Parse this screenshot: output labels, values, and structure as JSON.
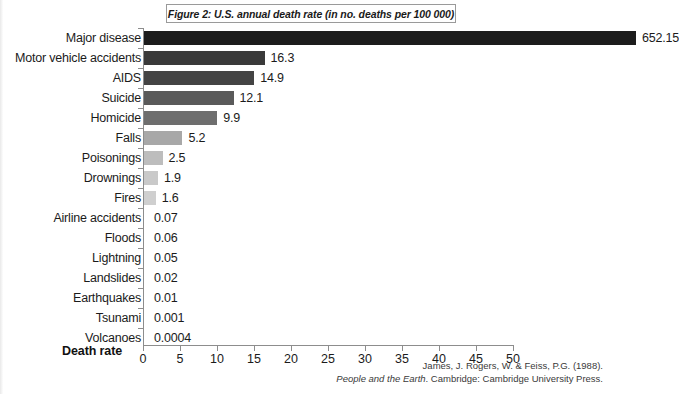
{
  "figure": {
    "title": "Figure 2: U.S. annual death rate (in no. deaths per 100 000)"
  },
  "axis": {
    "x_title": "Death rate",
    "ticks": [
      "0",
      "5",
      "10",
      "15",
      "20",
      "25",
      "30",
      "35",
      "40",
      "45",
      "50"
    ]
  },
  "source": {
    "line1": "James, J. Rogers, W. & Feiss, P.G. (1988).",
    "line2_italic": "People and the Earth",
    "line2_rest": ". Cambridge: Cambridge University Press."
  },
  "chart_data": {
    "type": "bar",
    "orientation": "horizontal",
    "title": "Figure 2: U.S. annual death rate (in no. deaths per 100 000)",
    "xlabel": "Death rate",
    "ylabel": "",
    "xlim": [
      0,
      50
    ],
    "xticks": [
      0,
      5,
      10,
      15,
      20,
      25,
      30,
      35,
      40,
      45,
      50
    ],
    "grid": false,
    "legend": "none",
    "note": "Top bar (Major disease, 652.15) greatly exceeds the axis range and is drawn clipped to full plot width.",
    "categories": [
      "Major disease",
      "Motor vehicle accidents",
      "AIDS",
      "Suicide",
      "Homicide",
      "Falls",
      "Poisonings",
      "Drownings",
      "Fires",
      "Airline accidents",
      "Floods",
      "Lightning",
      "Landslides",
      "Earthquakes",
      "Tsunami",
      "Volcanoes"
    ],
    "values": [
      652.15,
      16.3,
      14.9,
      12.1,
      9.9,
      5.2,
      2.5,
      1.9,
      1.6,
      0.07,
      0.06,
      0.05,
      0.02,
      0.01,
      0.001,
      0.0004
    ],
    "value_labels": [
      "652.15",
      "16.3",
      "14.9",
      "12.1",
      "9.9",
      "5.2",
      "2.5",
      "1.9",
      "1.6",
      "0.07",
      "0.06",
      "0.05",
      "0.02",
      "0.01",
      "0.001",
      "0.0004"
    ],
    "bar_colors": [
      "#1c1c1c",
      "#3a3a3a",
      "#444444",
      "#5a5a5a",
      "#6e6e6e",
      "#a8a8a8",
      "#bdbdbd",
      "#c9c9c9",
      "#cfcfcf",
      "#d8d8d8",
      "#dcdcdc",
      "#dedede",
      "#e0e0e0",
      "#e2e2e2",
      "#e4e4e4",
      "#e6e6e6"
    ]
  }
}
